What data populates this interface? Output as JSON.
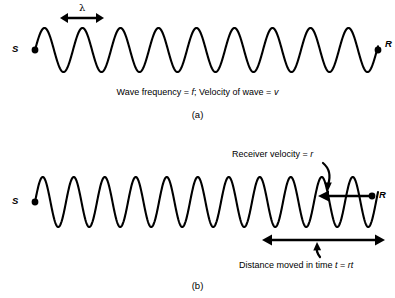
{
  "figure": {
    "type": "physics-diagram",
    "background_color": "#ffffff",
    "stroke_color": "#000000"
  },
  "panel_a": {
    "label": "(a)",
    "caption_part1": "Wave frequency = ",
    "caption_var1": "f",
    "caption_part2": ";  Velocity of wave = ",
    "caption_var2": "v",
    "source_label": "S",
    "receiver_label": "R",
    "wavelength_symbol": "λ",
    "wave": {
      "cycles": 9,
      "amplitude": 22,
      "wavelength": 38,
      "center_y": 50,
      "x_start": 35,
      "x_end": 378
    },
    "wavelength_marker": {
      "x_start": 60,
      "x_end": 104,
      "y": 18
    }
  },
  "panel_b": {
    "label": "(b)",
    "source_label": "S",
    "receiver_label": "R",
    "receiver_velocity_text_part1": "Receiver velocity = ",
    "receiver_velocity_var": "r",
    "distance_text_part1": "Distance moved in time ",
    "distance_var1": "t",
    "distance_text_part2": " = ",
    "distance_var2": "rt",
    "wave": {
      "cycles": 11,
      "amplitude": 25,
      "wavelength": 31,
      "center_y": 202,
      "x_start": 35,
      "x_end": 378
    },
    "velocity_arrow": {
      "x_tail": 372,
      "x_head": 318,
      "y": 196,
      "direction": "left"
    },
    "distance_arrow": {
      "x_start": 262,
      "x_end": 385,
      "y": 240,
      "double_headed": true
    }
  }
}
